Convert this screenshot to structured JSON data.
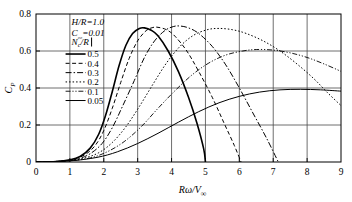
{
  "chart_data": {
    "type": "line",
    "title": "",
    "xlabel": "Rω/V∞",
    "ylabel": "C_P",
    "xlim": [
      0,
      9
    ],
    "ylim": [
      0,
      0.8
    ],
    "xticks": [
      "0",
      "1",
      "2",
      "3",
      "4",
      "5",
      "6",
      "7",
      "8",
      "9"
    ],
    "yticks": [
      "0",
      "0.2",
      "0.4",
      "0.6",
      "0.8"
    ],
    "grid": true,
    "legend_position": "upper-left",
    "legend_title": "Nᴄ/R",
    "annotations": [
      {
        "text": "H/R=1.0",
        "x": 1.05,
        "y": 0.755
      },
      {
        "text": "C₀₀=0.01",
        "x": 1.05,
        "y": 0.695
      }
    ],
    "series": [
      {
        "name": "0.5",
        "label": "0.5",
        "style": "solid",
        "width": 1.6,
        "dash": "none",
        "points": [
          [
            0.0,
            0.0
          ],
          [
            0.6,
            0.003
          ],
          [
            1.0,
            0.012
          ],
          [
            1.3,
            0.03
          ],
          [
            1.6,
            0.075
          ],
          [
            1.85,
            0.15
          ],
          [
            2.05,
            0.25
          ],
          [
            2.25,
            0.38
          ],
          [
            2.45,
            0.52
          ],
          [
            2.65,
            0.63
          ],
          [
            2.85,
            0.695
          ],
          [
            3.05,
            0.722
          ],
          [
            3.2,
            0.725
          ],
          [
            3.4,
            0.712
          ],
          [
            3.6,
            0.682
          ],
          [
            3.9,
            0.6
          ],
          [
            4.2,
            0.49
          ],
          [
            4.5,
            0.35
          ],
          [
            4.75,
            0.21
          ],
          [
            4.95,
            0.07
          ],
          [
            5.0,
            0.0
          ]
        ]
      },
      {
        "name": "0.4",
        "label": "0.4",
        "style": "dashed",
        "width": 1.0,
        "dash": "4,2.5",
        "points": [
          [
            0.0,
            0.0
          ],
          [
            0.7,
            0.004
          ],
          [
            1.1,
            0.015
          ],
          [
            1.45,
            0.04
          ],
          [
            1.75,
            0.09
          ],
          [
            2.0,
            0.17
          ],
          [
            2.25,
            0.29
          ],
          [
            2.5,
            0.43
          ],
          [
            2.75,
            0.56
          ],
          [
            3.0,
            0.655
          ],
          [
            3.25,
            0.71
          ],
          [
            3.45,
            0.727
          ],
          [
            3.6,
            0.728
          ],
          [
            3.85,
            0.715
          ],
          [
            4.1,
            0.68
          ],
          [
            4.45,
            0.6
          ],
          [
            4.8,
            0.49
          ],
          [
            5.2,
            0.35
          ],
          [
            5.55,
            0.21
          ],
          [
            5.85,
            0.09
          ],
          [
            6.05,
            0.0
          ]
        ]
      },
      {
        "name": "0.3",
        "label": "0.3",
        "style": "dash-dot",
        "width": 1.0,
        "dash": "6,2,1.5,2",
        "points": [
          [
            0.0,
            0.0
          ],
          [
            0.8,
            0.005
          ],
          [
            1.25,
            0.018
          ],
          [
            1.6,
            0.045
          ],
          [
            1.95,
            0.1
          ],
          [
            2.25,
            0.185
          ],
          [
            2.55,
            0.3
          ],
          [
            2.9,
            0.44
          ],
          [
            3.2,
            0.565
          ],
          [
            3.5,
            0.655
          ],
          [
            3.8,
            0.71
          ],
          [
            4.05,
            0.732
          ],
          [
            4.25,
            0.735
          ],
          [
            4.5,
            0.725
          ],
          [
            4.8,
            0.695
          ],
          [
            5.2,
            0.625
          ],
          [
            5.6,
            0.525
          ],
          [
            6.0,
            0.4
          ],
          [
            6.4,
            0.265
          ],
          [
            6.8,
            0.13
          ],
          [
            7.15,
            0.0
          ]
        ]
      },
      {
        "name": "0.2",
        "label": "0.2",
        "style": "dotted-dash",
        "width": 1.0,
        "dash": "1.5,2",
        "points": [
          [
            0.0,
            0.0
          ],
          [
            0.9,
            0.006
          ],
          [
            1.4,
            0.02
          ],
          [
            1.85,
            0.05
          ],
          [
            2.25,
            0.105
          ],
          [
            2.65,
            0.19
          ],
          [
            3.05,
            0.3
          ],
          [
            3.45,
            0.42
          ],
          [
            3.85,
            0.535
          ],
          [
            4.25,
            0.625
          ],
          [
            4.65,
            0.685
          ],
          [
            5.05,
            0.715
          ],
          [
            5.4,
            0.722
          ],
          [
            5.8,
            0.715
          ],
          [
            6.2,
            0.695
          ],
          [
            6.7,
            0.655
          ],
          [
            7.2,
            0.6
          ],
          [
            7.7,
            0.53
          ],
          [
            8.2,
            0.45
          ],
          [
            8.6,
            0.375
          ],
          [
            9.0,
            0.305
          ]
        ]
      },
      {
        "name": "0.1",
        "label": "0.1",
        "style": "dash-dot-dot",
        "width": 0.9,
        "dash": "5,1.8,1.2,1.8,1.2,1.8",
        "points": [
          [
            0.0,
            0.0
          ],
          [
            1.0,
            0.007
          ],
          [
            1.6,
            0.022
          ],
          [
            2.1,
            0.055
          ],
          [
            2.6,
            0.11
          ],
          [
            3.1,
            0.19
          ],
          [
            3.6,
            0.29
          ],
          [
            4.1,
            0.385
          ],
          [
            4.6,
            0.47
          ],
          [
            5.1,
            0.535
          ],
          [
            5.6,
            0.578
          ],
          [
            6.1,
            0.6
          ],
          [
            6.5,
            0.608
          ],
          [
            7.0,
            0.605
          ],
          [
            7.5,
            0.59
          ],
          [
            8.0,
            0.565
          ],
          [
            8.5,
            0.53
          ],
          [
            9.0,
            0.49
          ]
        ]
      },
      {
        "name": "0.05",
        "label": "0.05",
        "style": "solid",
        "width": 1.0,
        "dash": "none",
        "points": [
          [
            0.0,
            0.0
          ],
          [
            1.0,
            0.006
          ],
          [
            1.8,
            0.025
          ],
          [
            2.4,
            0.055
          ],
          [
            3.0,
            0.1
          ],
          [
            3.6,
            0.155
          ],
          [
            4.2,
            0.215
          ],
          [
            4.8,
            0.272
          ],
          [
            5.4,
            0.32
          ],
          [
            6.0,
            0.355
          ],
          [
            6.6,
            0.378
          ],
          [
            7.2,
            0.39
          ],
          [
            7.8,
            0.393
          ],
          [
            8.4,
            0.39
          ],
          [
            9.0,
            0.383
          ]
        ]
      }
    ]
  }
}
